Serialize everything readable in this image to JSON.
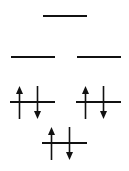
{
  "diagram": {
    "type": "molecular-orbital-energy-diagram",
    "title": "Molecular Orbital Energy Level Diagram",
    "background_color": "#ffffff",
    "line_color": "#111111",
    "arrow_color": "#111111",
    "total_electrons": 6,
    "levels": [
      {
        "id": "level-top",
        "name": "top-antibonding-level",
        "row": 1,
        "occupancy": 0,
        "orbitals": [
          {
            "id": "orbital-top",
            "name": "orbital-top-center",
            "x": 43,
            "y": 15,
            "width": 44,
            "electrons": []
          }
        ]
      },
      {
        "id": "level-middle",
        "name": "middle-degenerate-level",
        "row": 2,
        "occupancy": 0,
        "orbitals": [
          {
            "id": "orbital-middle-left",
            "name": "orbital-middle-left",
            "x": 11,
            "y": 56,
            "width": 44,
            "electrons": []
          },
          {
            "id": "orbital-middle-right",
            "name": "orbital-middle-right",
            "x": 77,
            "y": 56,
            "width": 44,
            "electrons": []
          }
        ]
      },
      {
        "id": "level-lower",
        "name": "lower-degenerate-level",
        "row": 3,
        "occupancy": 4,
        "orbitals": [
          {
            "id": "orbital-lower-left",
            "name": "orbital-lower-left",
            "x": 10,
            "y": 101,
            "width": 45,
            "electrons": [
              {
                "spin": "up",
                "offset_x": 9
              },
              {
                "spin": "down",
                "offset_x": 27
              }
            ]
          },
          {
            "id": "orbital-lower-right",
            "name": "orbital-lower-right",
            "x": 76,
            "y": 101,
            "width": 45,
            "electrons": [
              {
                "spin": "up",
                "offset_x": 9
              },
              {
                "spin": "down",
                "offset_x": 27
              }
            ]
          }
        ]
      },
      {
        "id": "level-bottom",
        "name": "bottom-bonding-level",
        "row": 4,
        "occupancy": 2,
        "orbitals": [
          {
            "id": "orbital-bottom",
            "name": "orbital-bottom-center",
            "x": 42,
            "y": 142,
            "width": 45,
            "electrons": [
              {
                "spin": "up",
                "offset_x": 9
              },
              {
                "spin": "down",
                "offset_x": 27
              }
            ]
          }
        ]
      }
    ]
  }
}
